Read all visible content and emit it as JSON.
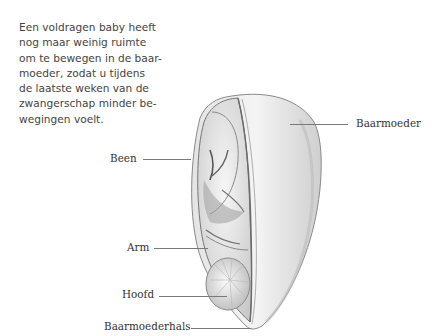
{
  "intro_text": {
    "lines": [
      "Een voldragen baby heeft",
      "nog maar weinig ruimte",
      "om te bewegen in de baar-",
      "moeder, zodat u tijdens",
      "de laatste weken van de",
      "zwangerschap minder be-",
      "wegingen voelt."
    ]
  },
  "labels": {
    "uterus": "Baarmoeder",
    "leg": "Been",
    "arm": "Arm",
    "head": "Hoofd",
    "cervix": "Baarmoederhals"
  },
  "illustration": {
    "subject": "cross-section-uterus-full-term-fetus",
    "style": "pencil-drawing"
  }
}
